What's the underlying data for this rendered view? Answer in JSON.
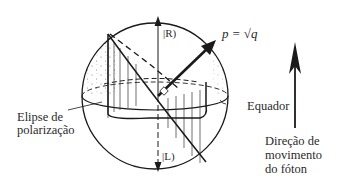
{
  "diagram": {
    "type": "poincare-sphere",
    "labels": {
      "right_state": "|R)",
      "left_state": "|L)",
      "point": "p = √q",
      "polarization_ellipse_line1": "Elipse de",
      "polarization_ellipse_line2": "polarização",
      "equator": "Equador",
      "direction_line1": "Direção de",
      "direction_line2": "movimento",
      "direction_line3": "do fóton"
    },
    "colors": {
      "stroke": "#1a1a1a",
      "stipple": "#555555",
      "background": "#ffffff"
    }
  }
}
